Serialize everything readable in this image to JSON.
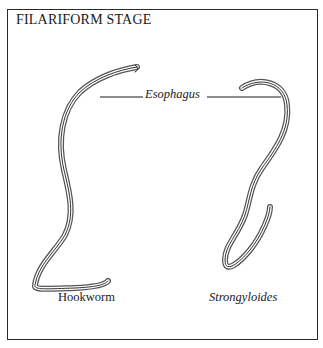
{
  "figure": {
    "title": "FILARIFORM STAGE",
    "pointer_label": "Esophagus",
    "specimens": [
      {
        "label": "Hookworm",
        "style": "normal"
      },
      {
        "label": "Strongyloides",
        "style": "italic"
      }
    ],
    "colors": {
      "ink": "#1a1a1a",
      "border": "#2a2a2a",
      "background": "#ffffff"
    }
  }
}
